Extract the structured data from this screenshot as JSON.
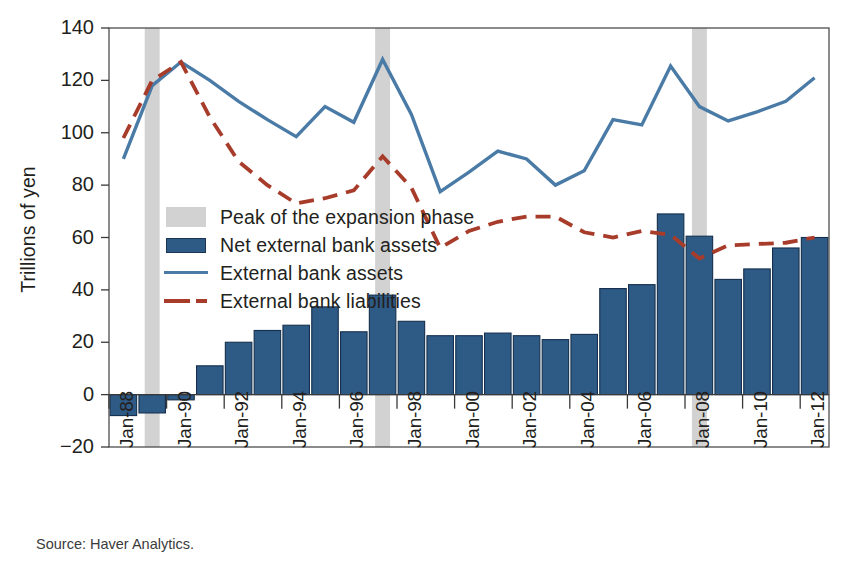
{
  "source_note": "Source: Haver Analytics.",
  "axes": {
    "ylabel": "Trillions of yen",
    "yticks": [
      "140",
      "120",
      "100",
      "80",
      "60",
      "40",
      "20",
      "0",
      "−20"
    ],
    "xticks": [
      "Jan-88",
      "Jan-90",
      "Jan-92",
      "Jan-94",
      "Jan-96",
      "Jan-98",
      "Jan-00",
      "Jan-02",
      "Jan-04",
      "Jan-06",
      "Jan-08",
      "Jan-10",
      "Jan-12"
    ]
  },
  "legend": [
    {
      "label": "Peak of the expansion phase",
      "key": "band-swatch",
      "color": "#d2d2d2"
    },
    {
      "label": "Net external bank assets",
      "key": "bar-swatch",
      "color": "#2e5a86"
    },
    {
      "label": "External bank assets",
      "key": "line-swatch",
      "color": "#4a7ba6"
    },
    {
      "label": "External bank liabilities",
      "key": "dashed-line-swatch",
      "color": "#a83c2b"
    }
  ],
  "chart_data": {
    "type": "bar",
    "title": "",
    "xlabel": "",
    "ylabel": "Trillions of yen",
    "ylim": [
      -20,
      140
    ],
    "ytick_step": 20,
    "grid": false,
    "legend_position": "inside-left",
    "categories": [
      "Jan-88",
      "Jan-89",
      "Jan-90",
      "Jan-91",
      "Jan-92",
      "Jan-93",
      "Jan-94",
      "Jan-95",
      "Jan-96",
      "Jan-97",
      "Jan-98",
      "Jan-99",
      "Jan-00",
      "Jan-01",
      "Jan-02",
      "Jan-03",
      "Jan-04",
      "Jan-05",
      "Jan-06",
      "Jan-07",
      "Jan-08",
      "Jan-09",
      "Jan-10",
      "Jan-11",
      "Jan-12"
    ],
    "series": [
      {
        "name": "Net external bank assets",
        "type": "bar",
        "color": "#2e5a86",
        "values": [
          -8,
          -7,
          -2,
          11,
          20,
          24.5,
          26.5,
          33.5,
          24,
          38,
          28,
          22.5,
          22.5,
          23.5,
          22.5,
          21,
          23,
          40.5,
          42,
          69,
          60.5,
          44,
          48,
          56,
          60
        ]
      },
      {
        "name": "External bank assets",
        "type": "line",
        "color": "#4a7ba6",
        "values": [
          90,
          118,
          127,
          120,
          112,
          105,
          98.5,
          110,
          104,
          128,
          107,
          77.5,
          85,
          93,
          90,
          80,
          85.5,
          105,
          103,
          125.5,
          110,
          104.5,
          108,
          112,
          121
        ]
      },
      {
        "name": "External bank liabilities",
        "type": "line",
        "dash": true,
        "color": "#a83c2b",
        "values": [
          98,
          120,
          127,
          106,
          89,
          80,
          73,
          75,
          78,
          91,
          79,
          56,
          62.5,
          66,
          68,
          68,
          62,
          60,
          62.5,
          61,
          52,
          57,
          57.5,
          58,
          60
        ]
      }
    ],
    "shaded_bands": [
      {
        "label": "Peak of the expansion phase",
        "at": "Jan-89",
        "color": "#d2d2d2"
      },
      {
        "label": "Peak of the expansion phase",
        "at": "Jan-97",
        "color": "#d2d2d2"
      },
      {
        "label": "Peak of the expansion phase",
        "at": "Jan-08",
        "color": "#d2d2d2"
      }
    ]
  }
}
